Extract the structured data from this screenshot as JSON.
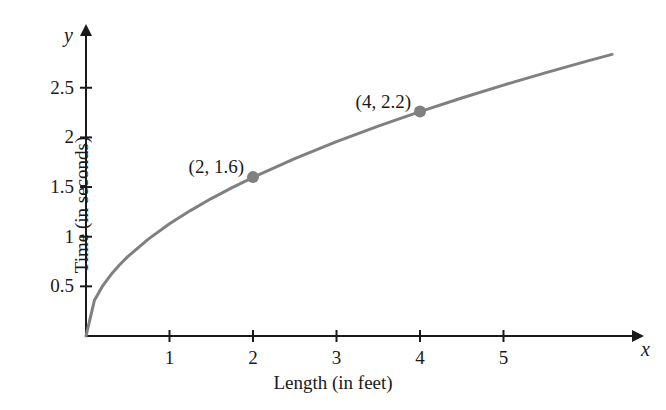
{
  "chart_data": {
    "type": "line",
    "title": "",
    "xlabel": "Length (in feet)",
    "ylabel": "Time (in seconds)",
    "x_axis_variable": "x",
    "y_axis_variable": "y",
    "xlim": [
      0,
      6.6
    ],
    "ylim": [
      0,
      2.9
    ],
    "xticks": [
      1,
      2,
      3,
      4,
      5
    ],
    "xtick_labels": [
      "1",
      "2",
      "3",
      "4",
      "5"
    ],
    "yticks": [
      0.5,
      1,
      1.5,
      2,
      2.5
    ],
    "ytick_labels": [
      "0.5",
      "1",
      "1.5",
      "2",
      "2.5"
    ],
    "grid": false,
    "legend": "none",
    "curve_description": "square root curve through origin",
    "curve_color": "#808080",
    "curve_formula_coefficient": 1.13,
    "curve_x_range": [
      0,
      6.3
    ],
    "series": [
      {
        "name": "pendulum period",
        "x": [
          0,
          0.1,
          0.2,
          0.3,
          0.4,
          0.5,
          0.75,
          1,
          1.25,
          1.5,
          1.75,
          2,
          2.5,
          3,
          3.5,
          4,
          4.5,
          5,
          5.5,
          6,
          6.3
        ],
        "y": [
          0,
          0.357,
          0.505,
          0.619,
          0.715,
          0.799,
          0.978,
          1.13,
          1.263,
          1.384,
          1.494,
          1.598,
          1.786,
          1.957,
          2.114,
          2.26,
          2.397,
          2.527,
          2.65,
          2.768,
          2.836
        ]
      }
    ],
    "labeled_points": [
      {
        "label": "(2, 1.6)",
        "x": 2,
        "y": 1.6,
        "marker_color": "#808080"
      },
      {
        "label": "(4, 2.2)",
        "x": 4,
        "y": 2.26,
        "marker_color": "#808080"
      }
    ]
  },
  "axes": {
    "axis_color": "#1a1a1a",
    "x_variable_label": "x",
    "y_variable_label": "y",
    "x_title": "Length (in feet)",
    "y_title": "Time (in seconds)"
  }
}
